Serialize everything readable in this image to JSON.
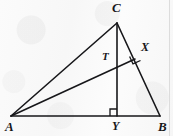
{
  "figure": {
    "kind": "geometry-diagram",
    "canvas": {
      "width": 173,
      "height": 136
    },
    "style": {
      "stroke_color": "#17171a",
      "stroke_width": 1.6,
      "background_color": "#fdfdfd",
      "edge_line_color": "#d8d8d8"
    },
    "points": [
      {
        "name": "A",
        "label": "A",
        "x": 11,
        "y": 116,
        "label_x": 5,
        "label_y": 120
      },
      {
        "name": "B",
        "label": "B",
        "x": 160,
        "y": 116,
        "label_x": 158,
        "label_y": 120
      },
      {
        "name": "C",
        "label": "C",
        "x": 117,
        "y": 23,
        "label_x": 112,
        "label_y": 1
      },
      {
        "name": "T",
        "label": "T",
        "x": 117,
        "y": 62,
        "label_x": 102,
        "label_y": 51
      },
      {
        "name": "X",
        "label": "X",
        "x": 135,
        "y": 59,
        "label_x": 141,
        "label_y": 41
      },
      {
        "name": "Y",
        "label": "Y",
        "x": 117,
        "y": 116,
        "label_x": 112,
        "label_y": 120
      }
    ],
    "segments": [
      {
        "name": "segment-AB",
        "from": "A",
        "to": "B"
      },
      {
        "name": "segment-AC",
        "from": "A",
        "to": "C"
      },
      {
        "name": "segment-CB",
        "from": "C",
        "to": "B"
      },
      {
        "name": "segment-CY",
        "from": "C",
        "to": "Y"
      },
      {
        "name": "segment-AX",
        "from": "A",
        "to": "X"
      }
    ],
    "right_angles": [
      {
        "name": "right-angle-at-Y",
        "vertex": "Y",
        "size": 7,
        "orientation": "upper-left"
      },
      {
        "name": "right-angle-at-X",
        "vertex": "X",
        "size": 7,
        "orientation": "between-AX-and-CB"
      }
    ],
    "labels": {
      "A": "A",
      "B": "B",
      "C": "C",
      "T": "T",
      "X": "X",
      "Y": "Y"
    }
  }
}
